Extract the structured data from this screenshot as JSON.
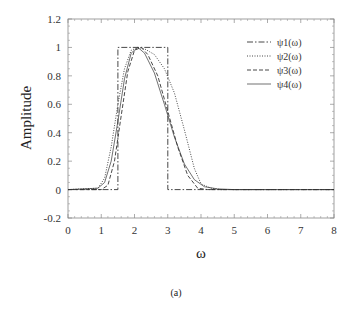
{
  "chart_data": {
    "type": "line",
    "title": "",
    "caption": "(a)",
    "xlabel": "ω",
    "ylabel": "Amplitude",
    "xlim": [
      0,
      8
    ],
    "ylim": [
      -0.2,
      1.2
    ],
    "xticks": [
      "0",
      "1",
      "2",
      "3",
      "4",
      "5",
      "6",
      "7",
      "8"
    ],
    "yticks": [
      "-0.2",
      "0",
      "0.2",
      "0.4",
      "0.6",
      "0.8",
      "1",
      "1.2"
    ],
    "grid": false,
    "legend_position": "upper right",
    "series": [
      {
        "name": "ψ1(ω)",
        "style": "dash-dot",
        "x": [
          0,
          1.5,
          1.5,
          3.0,
          3.0,
          8
        ],
        "y": [
          0,
          0,
          1,
          1,
          0,
          0
        ]
      },
      {
        "name": "ψ2(ω)",
        "style": "dotted",
        "x": [
          0,
          0.9,
          1.1,
          1.3,
          1.5,
          1.7,
          1.9,
          2.1,
          2.3,
          2.6,
          2.9,
          3.2,
          3.5,
          3.8,
          4.0,
          4.3,
          4.6,
          8
        ],
        "y": [
          0,
          0.01,
          0.08,
          0.3,
          0.6,
          0.85,
          0.98,
          1.0,
          0.99,
          0.95,
          0.85,
          0.68,
          0.42,
          0.15,
          0.04,
          0.01,
          0,
          0
        ]
      },
      {
        "name": "ψ3(ω)",
        "style": "dashed",
        "x": [
          0,
          1.0,
          1.2,
          1.4,
          1.6,
          1.8,
          2.0,
          2.2,
          2.4,
          2.7,
          3.0,
          3.3,
          3.6,
          3.9,
          4.2,
          8
        ],
        "y": [
          0,
          0,
          0.03,
          0.2,
          0.52,
          0.83,
          0.98,
          1.0,
          0.95,
          0.8,
          0.55,
          0.3,
          0.1,
          0.01,
          0,
          0
        ]
      },
      {
        "name": "ψ4(ω)",
        "style": "solid",
        "x": [
          0,
          0.9,
          1.1,
          1.3,
          1.5,
          1.7,
          1.9,
          2.1,
          2.3,
          2.6,
          2.9,
          3.2,
          3.5,
          3.8,
          4.1,
          4.5,
          5.0,
          8
        ],
        "y": [
          0,
          0.01,
          0.05,
          0.2,
          0.48,
          0.78,
          0.96,
          1.0,
          0.96,
          0.82,
          0.6,
          0.37,
          0.18,
          0.07,
          0.02,
          0.005,
          0,
          0
        ]
      }
    ]
  }
}
